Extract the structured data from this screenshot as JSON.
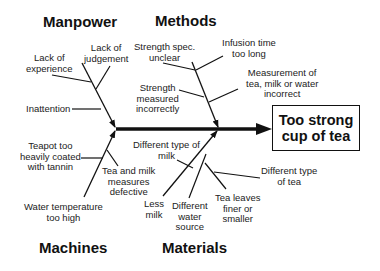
{
  "effect": {
    "line1": "Too strong",
    "line2": "cup of tea"
  },
  "categories": {
    "manpower": {
      "label": "Manpower",
      "causes": {
        "lack_experience": [
          "Lack of",
          "experience"
        ],
        "lack_judgement": [
          "Lack of",
          "judgement"
        ],
        "inattention": [
          "Inattention"
        ]
      }
    },
    "methods": {
      "label": "Methods",
      "causes": {
        "strength_spec": [
          "Strength spec.",
          "unclear"
        ],
        "infusion_time": [
          "Infusion time",
          "too long"
        ],
        "strength_measured": [
          "Strength",
          "measured",
          "incorrectly"
        ],
        "measurement": [
          "Measurement of",
          "tea, milk or water",
          "incorrect"
        ]
      }
    },
    "machines": {
      "label": "Machines",
      "causes": {
        "teapot": [
          "Teapot too",
          "heavily coated",
          "with tannin"
        ],
        "tea_milk_measures": [
          "Tea and milk",
          "measures",
          "defective"
        ],
        "water_temp": [
          "Water temperature",
          "too high"
        ]
      }
    },
    "materials": {
      "label": "Materials",
      "causes": {
        "type_milk": [
          "Different type of",
          "milk"
        ],
        "less_milk": [
          "Less",
          "milk"
        ],
        "water_source": [
          "Different",
          "water",
          "source"
        ],
        "tea_leaves": [
          "Tea leaves",
          "finer or",
          "smaller"
        ],
        "type_tea": [
          "Different type",
          "of tea"
        ]
      }
    }
  },
  "colors": {
    "line": "#111111",
    "text": "#222222",
    "background": "#ffffff"
  }
}
